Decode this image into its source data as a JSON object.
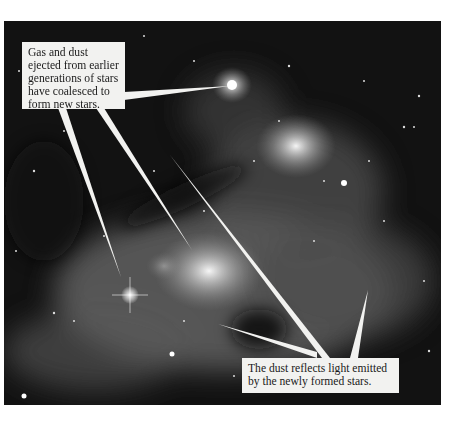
{
  "figure": {
    "colors": {
      "background": "#ffffff",
      "sky": "#111111",
      "nebula": "#cfcfcf",
      "callout_bg": "#f2f2f0",
      "callout_text": "#1a1a1a"
    }
  },
  "callouts": {
    "top": {
      "lines": [
        "Gas and dust",
        "ejected from earlier",
        "generations of stars",
        "have coalesced to",
        "form new stars."
      ]
    },
    "bottom": {
      "lines": [
        "The dust reflects light emitted",
        "by the newly formed stars."
      ]
    }
  }
}
